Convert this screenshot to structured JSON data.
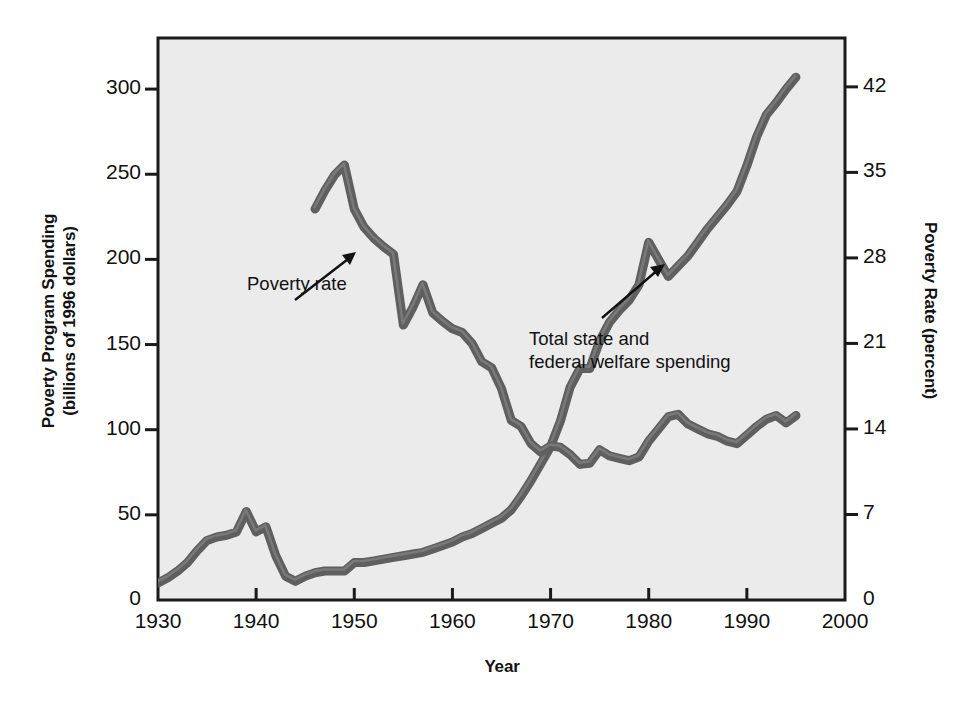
{
  "chart_data": {
    "type": "line",
    "title": "",
    "xlabel": "Year",
    "ylabel": "Poverty Program Spending (billions of 1996 dollars)",
    "ylabel_right": "Poverty Rate (percent)",
    "xlim": [
      1930,
      2000
    ],
    "ylim": [
      0,
      330
    ],
    "ylim_right": [
      0,
      46
    ],
    "grid": false,
    "legend": "none (in-plot annotations with arrows)",
    "xticks": [
      "1930",
      "1940",
      "1950",
      "1960",
      "1970",
      "1980",
      "1990",
      "2000"
    ],
    "xtick_values": [
      1930,
      1940,
      1950,
      1960,
      1970,
      1980,
      1990,
      2000
    ],
    "yticks_left": [
      "0",
      "50",
      "100",
      "150",
      "200",
      "250",
      "300"
    ],
    "ytick_values_left": [
      0,
      50,
      100,
      150,
      200,
      250,
      300
    ],
    "yticks_right": [
      "0",
      "7",
      "14",
      "21",
      "28",
      "35",
      "42"
    ],
    "ytick_values_right": [
      0,
      7,
      14,
      21,
      28,
      35,
      42
    ],
    "series": [
      {
        "name": "Total state and federal welfare spending",
        "axis": "left",
        "units": "billions of 1996 dollars",
        "x": [
          1930,
          1931,
          1932,
          1933,
          1934,
          1935,
          1936,
          1937,
          1938,
          1939,
          1940,
          1941,
          1942,
          1943,
          1944,
          1945,
          1946,
          1947,
          1948,
          1949,
          1950,
          1951,
          1952,
          1953,
          1954,
          1955,
          1956,
          1957,
          1958,
          1959,
          1960,
          1961,
          1962,
          1963,
          1964,
          1965,
          1966,
          1967,
          1968,
          1969,
          1970,
          1971,
          1972,
          1973,
          1974,
          1975,
          1976,
          1977,
          1978,
          1979,
          1980,
          1981,
          1982,
          1983,
          1984,
          1985,
          1986,
          1987,
          1988,
          1989,
          1990,
          1991,
          1992,
          1993,
          1994,
          1995
        ],
        "values": [
          10,
          13,
          17,
          22,
          29,
          35,
          37,
          38,
          40,
          52,
          40,
          43,
          26,
          14,
          11,
          14,
          16,
          17,
          17,
          17,
          22,
          22,
          23,
          24,
          25,
          26,
          27,
          28,
          30,
          32,
          34,
          37,
          39,
          42,
          45,
          48,
          53,
          61,
          70,
          80,
          90,
          105,
          125,
          136,
          136,
          152,
          163,
          170,
          176,
          185,
          210,
          200,
          190,
          196,
          202,
          210,
          218,
          225,
          232,
          240,
          255,
          272,
          285,
          292,
          300,
          307
        ]
      },
      {
        "name": "Poverty rate",
        "axis": "right",
        "units": "percent",
        "x": [
          1946,
          1947,
          1948,
          1949,
          1950,
          1951,
          1952,
          1953,
          1954,
          1955,
          1956,
          1957,
          1958,
          1959,
          1960,
          1961,
          1962,
          1963,
          1964,
          1965,
          1966,
          1967,
          1968,
          1969,
          1970,
          1971,
          1972,
          1973,
          1974,
          1975,
          1976,
          1977,
          1978,
          1979,
          1980,
          1981,
          1982,
          1983,
          1984,
          1985,
          1986,
          1987,
          1988,
          1989,
          1990,
          1991,
          1992,
          1993,
          1994,
          1995
        ],
        "values": [
          32.0,
          33.5,
          34.8,
          35.6,
          32.0,
          30.5,
          29.6,
          28.9,
          28.3,
          22.5,
          24.0,
          25.8,
          23.5,
          22.8,
          22.2,
          21.9,
          21.0,
          19.5,
          19.0,
          17.3,
          14.7,
          14.2,
          12.8,
          12.1,
          12.6,
          12.5,
          11.9,
          11.1,
          11.2,
          12.3,
          11.8,
          11.6,
          11.4,
          11.7,
          13.0,
          14.0,
          15.0,
          15.2,
          14.4,
          14.0,
          13.6,
          13.4,
          13.0,
          12.8,
          13.5,
          14.2,
          14.8,
          15.1,
          14.5,
          15.1
        ]
      }
    ],
    "annotations": [
      {
        "text": "Poverty rate",
        "points_to_series": "Poverty rate",
        "arrow_from": [
          295,
          300
        ],
        "arrow_to": [
          355,
          255
        ]
      },
      {
        "text": "Total state and\nfederal welfare spending",
        "points_to_series": "Total state and federal welfare spending",
        "arrow_from": [
          602,
          318
        ],
        "arrow_to": [
          663,
          265
        ]
      }
    ],
    "style": {
      "plot_background": "#ebebeb",
      "frame_color": "#1a1a1a",
      "line_color": "#5f5f5f",
      "line_highlight_color": "#8e8e8e",
      "line_width_px": 9,
      "page_background": "#ffffff"
    }
  }
}
